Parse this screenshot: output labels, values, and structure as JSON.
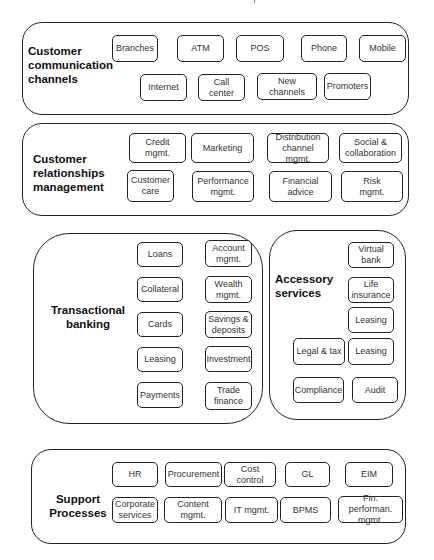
{
  "diagram": {
    "groups": [
      {
        "id": "customer-communication-channels",
        "label": "Customer\ncommunication\nchannels",
        "nodes": [
          "Branches",
          "ATM",
          "POS",
          "Phone",
          "Mobile",
          "Internet",
          "Call center",
          "New channels",
          "Promoters"
        ]
      },
      {
        "id": "customer-relationships-management",
        "label": "Customer\nrelationships\nmanagement",
        "nodes": [
          "Credit\nmgmt.",
          "Marketing",
          "Distribution\nchannel mgmt.",
          "Social &\ncollaboration",
          "Customer\ncare",
          "Performance\nmgmt.",
          "Financial\nadvice",
          "Risk\nmgmt."
        ]
      },
      {
        "id": "transactional-banking",
        "label": "Transactional\nbanking",
        "nodes": [
          "Loans",
          "Account\nmgmt.",
          "Collateral",
          "Wealth\nmgmt.",
          "Cards",
          "Savings &\ndeposits",
          "Leasing",
          "Investment",
          "Payments",
          "Trade\nfinance"
        ]
      },
      {
        "id": "accessory-services",
        "label": "Accessory\nservices",
        "nodes": [
          "Virtual\nbank",
          "Life\ninsurance",
          "Leasing",
          "Legal & tax",
          "Leasing",
          "Compliance",
          "Audit"
        ]
      },
      {
        "id": "support-processes",
        "label": "Support\nProcesses",
        "nodes": [
          "HR",
          "Procurement",
          "Cost control",
          "GL",
          "EIM",
          "Corporate\nservices",
          "Content\nmgmt.",
          "IT mgmt.",
          "BPMS",
          "Fin. performan.\nmgmt."
        ]
      }
    ]
  }
}
